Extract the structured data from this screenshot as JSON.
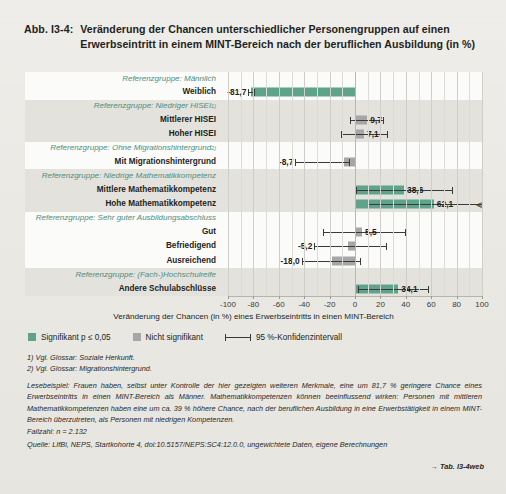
{
  "figure": {
    "number": "Abb. I3-4:",
    "title": "Veränderung der Chancen unterschiedlicher Personengruppen auf einen Erwerbseintritt in einem MINT-Bereich nach der beruflichen Ausbildung (in %)"
  },
  "legend": {
    "significant": "Signifikant p ≤ 0,05",
    "not_significant": "Nicht signifikant",
    "ci": "95 %-Konfidenzintervall",
    "color_significant": "#5fa38d",
    "color_not_significant": "#a6a6a6"
  },
  "axis": {
    "title": "Veränderung der Chancen (in %) eines Erwerbseintritts in einen MINT-Bereich",
    "ticks": [
      "-100",
      "-80",
      "-60",
      "-40",
      "-20",
      "0",
      "20",
      "40",
      "60",
      "80",
      "100"
    ]
  },
  "notes": {
    "fn1": "1) Vgl. Glossar: Soziale Herkunft.",
    "fn2": "2) Vgl. Glossar: Migrationshintergrund.",
    "reading": "Lesebeispiel: Frauen haben, selbst unter Kontrolle der hier gezeigten weiteren Merkmale, eine um 81,7 % geringere Chance eines Erwerbseintritts in einen MINT-Bereich als Männer. Mathematikkompetenzen können beeinflussend wirken: Personen mit mittleren Mathematikkompetenzen haben eine um ca. 39 % höhere Chance, nach der beruflichen Ausbildung in eine Erwerbstätigkeit in einem MINT-Bereich überzutreten, als Personen mit niedrigen Kompetenzen.",
    "cases": "Fallzahl: n = 2.132",
    "source": "Quelle: LIfBi, NEPS, Startkohorte 4, doi:10.5157/NEPS:SC4:12.0.0, ungewichtete Daten, eigene Berechnungen",
    "tabref": "→ Tab. I3-4web"
  },
  "chart_data": {
    "type": "bar",
    "orientation": "horizontal",
    "title": "Veränderung der Chancen unterschiedlicher Personengruppen auf einen Erwerbseintritt in einem MINT-Bereich nach der beruflichen Ausbildung (in %)",
    "xlabel": "Veränderung der Chancen (in %) eines Erwerbseintritts in einen MINT-Bereich",
    "ylabel": "",
    "xlim": [
      -100,
      100
    ],
    "xticks": [
      -100,
      -80,
      -60,
      -40,
      -20,
      0,
      20,
      40,
      60,
      80,
      100
    ],
    "grid": true,
    "legend_position": "below-axis",
    "rows": [
      {
        "kind": "reference",
        "label": "Referenzgruppe: Männlich",
        "band": false
      },
      {
        "kind": "data",
        "label": "Weiblich",
        "band": false,
        "value": -81.7,
        "value_label": "-81,7",
        "significant": true,
        "ci_low": -84.0,
        "ci_high": -78.5,
        "ci_truncated": false,
        "label_side": "left"
      },
      {
        "kind": "reference",
        "label": "Referenzgruppe: Niedriger HISEI",
        "footnote": "1)",
        "band": true
      },
      {
        "kind": "data",
        "label": "Mittlerer HISEI",
        "band": true,
        "value": 9.7,
        "value_label": "9,7",
        "significant": false,
        "ci_low": -4.0,
        "ci_high": 23.0,
        "ci_truncated": false,
        "label_side": "right"
      },
      {
        "kind": "data",
        "label": "Hoher HISEI",
        "band": true,
        "value": 7.1,
        "value_label": "7,1",
        "significant": false,
        "ci_low": -11.0,
        "ci_high": 26.0,
        "ci_truncated": false,
        "label_side": "right"
      },
      {
        "kind": "reference",
        "label": "Referenzgruppe: Ohne Migrationshintergrund",
        "footnote": "2)",
        "band": false
      },
      {
        "kind": "data",
        "label": "Mit Migrationshintergrund",
        "band": false,
        "value": -8.7,
        "value_label": "-8,7",
        "significant": false,
        "ci_low": -47.0,
        "ci_high": -4.0,
        "ci_truncated": false,
        "label_side": "left"
      },
      {
        "kind": "reference",
        "label": "Referenzgruppe: Niedrige Mathematikkompetenz",
        "band": true
      },
      {
        "kind": "data",
        "label": "Mittlere Mathematikkompetenz",
        "band": true,
        "value": 38.6,
        "value_label": "38,6",
        "significant": true,
        "ci_low": 1.0,
        "ci_high": 77.0,
        "ci_truncated": false,
        "label_side": "right"
      },
      {
        "kind": "data",
        "label": "Hohe Mathematikkompetenz",
        "band": true,
        "value": 62.1,
        "value_label": "62,1",
        "significant": true,
        "ci_low": 10.0,
        "ci_high": 100.0,
        "ci_truncated": true,
        "label_side": "right"
      },
      {
        "kind": "reference",
        "label": "Referenzgruppe: Sehr guter Ausbildungsabschluss",
        "band": false
      },
      {
        "kind": "data",
        "label": "Gut",
        "band": false,
        "value": 5.5,
        "value_label": "5,5",
        "significant": false,
        "ci_low": -25.0,
        "ci_high": 40.0,
        "ci_truncated": false,
        "label_side": "right"
      },
      {
        "kind": "data",
        "label": "Befriedigend",
        "band": false,
        "value": -5.2,
        "value_label": "-5,2",
        "significant": false,
        "ci_low": -32.0,
        "ci_high": 25.0,
        "ci_truncated": false,
        "label_side": "left"
      },
      {
        "kind": "data",
        "label": "Ausreichend",
        "band": false,
        "value": -18.0,
        "value_label": "-18,0",
        "significant": false,
        "ci_low": -42.0,
        "ci_high": 5.0,
        "ci_truncated": false,
        "label_side": "left"
      },
      {
        "kind": "reference",
        "label": "Referenzgruppe: (Fach-)Hochschulreife",
        "band": true
      },
      {
        "kind": "data",
        "label": "Andere Schulabschlüsse",
        "band": true,
        "value": 34.1,
        "value_label": "34,1",
        "significant": true,
        "ci_low": 2.0,
        "ci_high": 58.0,
        "ci_truncated": false,
        "label_side": "right"
      }
    ]
  }
}
